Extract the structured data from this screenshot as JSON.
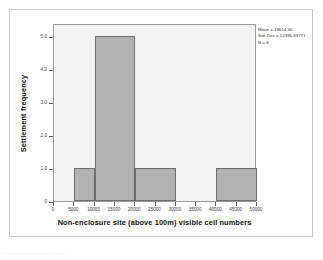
{
  "figure": {
    "background_color": "#ffffff",
    "card_border_color": "#c9c9c9",
    "plot_background_color": "#f3f3f3",
    "plot_border_color": "#9a9a9a",
    "bar_fill_color": "#b2b2b2",
    "bar_border_color": "#6f6f6f",
    "axis_color": "#5a5a5a"
  },
  "stats": {
    "mean_label": "Mean = 19614.50",
    "std_dev_label": "Std. Dev = 12391.33771",
    "n_label": "N = 8"
  },
  "footer": {
    "bleed_text": "...  ...  ..  ..    ......   ..  ......    ..   ...  .. ....  ....  ...  .."
  },
  "chart_data": {
    "type": "bar",
    "title": "",
    "subtitle": "",
    "xlabel": "Non-enclosure site (above 100m) visible cell numbers",
    "ylabel": "Settlement frequency",
    "xlim": [
      0,
      50000
    ],
    "ylim": [
      0,
      5.4
    ],
    "grid": false,
    "legend": null,
    "xticks": [
      0,
      5000,
      10000,
      15000,
      20000,
      25000,
      30000,
      35000,
      40000,
      45000,
      50000
    ],
    "xticklabels": [
      "0",
      "5000",
      "10000",
      "15000",
      "20000",
      "25000",
      "30000",
      "35000",
      "40000",
      "45000",
      "50000"
    ],
    "yticks": [
      0,
      1.0,
      2.0,
      3.0,
      4.0,
      5.0
    ],
    "yticklabels": [
      "0",
      "1.0",
      "2.0",
      "3.0",
      "4.0",
      "5.0"
    ],
    "bin_width": 5000,
    "bins": [
      {
        "x0": 5000,
        "x1": 10000,
        "value": 1
      },
      {
        "x0": 10000,
        "x1": 20000,
        "value": 5
      },
      {
        "x0": 20000,
        "x1": 30000,
        "value": 1
      },
      {
        "x0": 40000,
        "x1": 50000,
        "value": 1
      }
    ],
    "categories": [
      "5000-10000",
      "10000-20000",
      "20000-30000",
      "40000-50000"
    ],
    "values": [
      1,
      5,
      1,
      1
    ],
    "annotations": [
      "Mean = 19614.50",
      "Std. Dev = 12391.33771",
      "N = 8"
    ]
  }
}
